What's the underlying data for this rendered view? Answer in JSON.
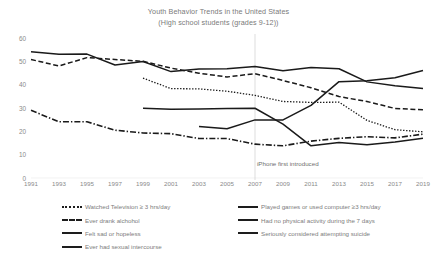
{
  "title": {
    "line1": "Youth Behavior Trends in the United States",
    "line2": "(High school students (grades 9-12))"
  },
  "annotation": {
    "event_label": "iPhone first introduced",
    "event_year": 2007
  },
  "axes": {
    "y_ticks": [
      "0",
      "10",
      "20",
      "30",
      "40",
      "50",
      "60"
    ],
    "x_ticks": [
      "1991",
      "1993",
      "1995",
      "1997",
      "1999",
      "2001",
      "2003",
      "2005",
      "2007",
      "2009",
      "2011",
      "2013",
      "2015",
      "2017",
      "2019"
    ]
  },
  "legend": {
    "left": [
      {
        "label": "Watched Television ≥ 3 hrs/day",
        "style": "dotted"
      },
      {
        "label": "Ever drank alchohol",
        "style": "dashed"
      },
      {
        "label": "Felt sad or hopeless",
        "style": "solid"
      },
      {
        "label": "Ever had sexual intercourse",
        "style": "solid"
      }
    ],
    "right": [
      {
        "label": "Played games or used computer ≥3 hrs/day",
        "style": "solid"
      },
      {
        "label": "Had no physical activity during the 7 days",
        "style": "solid"
      },
      {
        "label": "Seriously considered attempting suicide",
        "style": "solid"
      }
    ]
  },
  "chart_data": {
    "type": "line",
    "title": "Youth Behavior Trends in the United States (High school students (grades 9-12))",
    "xlabel": "",
    "ylabel": "",
    "ylim": [
      0,
      60
    ],
    "grid": false,
    "legend_position": "bottom",
    "x": [
      1991,
      1993,
      1995,
      1997,
      1999,
      2001,
      2003,
      2005,
      2007,
      2009,
      2011,
      2013,
      2015,
      2017,
      2019
    ],
    "annotations": [
      {
        "text": "iPhone first introduced",
        "x": 2007,
        "type": "vertical-line"
      }
    ],
    "series": [
      {
        "name": "Ever had sexual intercourse",
        "style": "solid",
        "x": [
          1991,
          1993,
          1995,
          1997,
          1999,
          2001,
          2003,
          2005,
          2007,
          2009,
          2011,
          2013,
          2015,
          2017,
          2019
        ],
        "values": [
          54.1,
          53.0,
          53.1,
          48.4,
          49.9,
          45.6,
          46.7,
          46.8,
          47.8,
          46.0,
          47.4,
          46.8,
          41.2,
          39.5,
          38.4
        ]
      },
      {
        "name": "Ever drank alchohol",
        "style": "dashed",
        "x": [
          1991,
          1993,
          1995,
          1997,
          1999,
          2001,
          2003,
          2005,
          2007,
          2009,
          2011,
          2013,
          2015,
          2017,
          2019
        ],
        "values": [
          50.8,
          48.0,
          51.6,
          50.8,
          50.0,
          47.1,
          44.9,
          43.3,
          44.7,
          41.8,
          38.7,
          34.9,
          32.8,
          29.8,
          29.2
        ]
      },
      {
        "name": "Watched Television ≥ 3 hrs/day",
        "style": "dotted",
        "x": [
          1999,
          2001,
          2003,
          2005,
          2007,
          2009,
          2011,
          2013,
          2015,
          2017,
          2019
        ],
        "values": [
          42.8,
          38.3,
          38.2,
          37.2,
          35.4,
          32.8,
          32.4,
          32.5,
          24.7,
          20.7,
          19.8
        ]
      },
      {
        "name": "Had no physical activity during the 7 days",
        "style": "solid",
        "x": [
          1999,
          2001,
          2003,
          2005,
          2007,
          2009,
          2011,
          2013,
          2015,
          2017,
          2019
        ],
        "values": [
          29.9,
          29.5,
          29.6,
          29.8,
          29.9,
          23.1,
          13.8,
          15.2,
          14.3,
          15.4,
          17.0
        ]
      },
      {
        "name": "Played games or used computer ≥3 hrs/day",
        "style": "solid",
        "x": [
          2003,
          2005,
          2007,
          2009,
          2011,
          2013,
          2015,
          2017,
          2019
        ],
        "values": [
          22.1,
          21.1,
          24.9,
          24.9,
          31.1,
          41.3,
          41.7,
          43.0,
          46.1
        ]
      },
      {
        "name": "Seriously considered attempting suicide",
        "style": "dashdot",
        "x": [
          1991,
          1993,
          1995,
          1997,
          1999,
          2001,
          2003,
          2005,
          2007,
          2009,
          2011,
          2013,
          2015,
          2017,
          2019
        ],
        "values": [
          29.0,
          24.1,
          24.1,
          20.5,
          19.3,
          19.0,
          16.9,
          16.9,
          14.5,
          13.8,
          15.8,
          17.0,
          17.7,
          17.2,
          18.8
        ]
      }
    ]
  }
}
